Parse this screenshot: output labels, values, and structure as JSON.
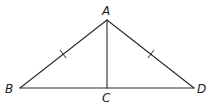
{
  "diagram": {
    "type": "geometry",
    "points": {
      "A": {
        "label": "A",
        "x": 107,
        "y": 20
      },
      "B": {
        "label": "B",
        "x": 20,
        "y": 88
      },
      "C": {
        "label": "C",
        "x": 107,
        "y": 88
      },
      "D": {
        "label": "D",
        "x": 194,
        "y": 88
      }
    },
    "segments": [
      {
        "from": "A",
        "to": "B",
        "tick_marks": 1
      },
      {
        "from": "A",
        "to": "D",
        "tick_marks": 1
      },
      {
        "from": "B",
        "to": "D",
        "tick_marks": 0
      },
      {
        "from": "A",
        "to": "C",
        "tick_marks": 0
      }
    ],
    "labels": {
      "A": "A",
      "B": "B",
      "C": "C",
      "D": "D"
    },
    "colors": {
      "line": "#2a2a2a",
      "label": "#222222",
      "background": "#ffffff"
    }
  }
}
